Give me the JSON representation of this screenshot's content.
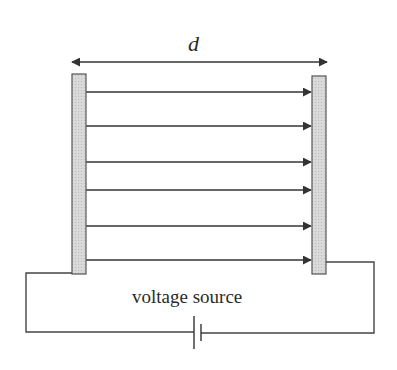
{
  "diagram": {
    "labels": {
      "separation": "d",
      "source": "voltage source"
    },
    "colors": {
      "line": "#333333",
      "plate_fill": "#d4d4d4",
      "plate_border": "#555555",
      "background": "#ffffff"
    },
    "plates": [
      {
        "name": "left-plate",
        "x": 72,
        "y": 74,
        "width": 14,
        "height": 200
      },
      {
        "name": "right-plate",
        "x": 312,
        "y": 76,
        "width": 14,
        "height": 198
      }
    ],
    "field_lines_y": [
      92,
      126,
      162,
      190,
      226,
      260
    ],
    "field_line_count": 6,
    "components": [
      "left plate",
      "right plate",
      "electric field arrows",
      "separation arrow d",
      "wires",
      "battery"
    ]
  }
}
